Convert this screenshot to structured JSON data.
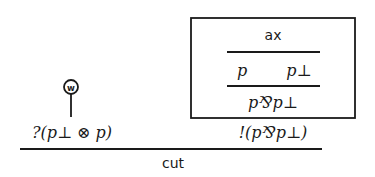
{
  "diagram": {
    "type": "proof-net",
    "box": {
      "axiom_label": "ax",
      "axiom_conclusions": [
        "p",
        "p⊥"
      ],
      "par_conclusion": "p⅋p⊥"
    },
    "left_formula": "?(p⊥ ⊗ p)",
    "right_formula": "!(p⅋p⊥)",
    "weakening_node_label": "w",
    "cut_label": "cut"
  }
}
